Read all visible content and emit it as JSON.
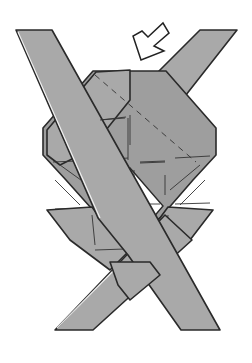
{
  "figure": {
    "type": "origami-fold-diagram",
    "colors": {
      "paper": "#a9a9a9",
      "outline": "#2a2a2a",
      "background": "#ffffff",
      "arrow_fill": "#ffffff"
    },
    "elements": [
      {
        "name": "strip-top-left-to-bottom-right",
        "role": "front strip"
      },
      {
        "name": "strip-top-right-to-bottom-left",
        "role": "back strip"
      },
      {
        "name": "central-body",
        "role": "folded octagon"
      },
      {
        "name": "center-diamond-opening",
        "role": "hole"
      },
      {
        "name": "fold-arrow",
        "role": "push/insert direction indicator",
        "direction": "down-left"
      }
    ],
    "label": "Origami folding step"
  }
}
